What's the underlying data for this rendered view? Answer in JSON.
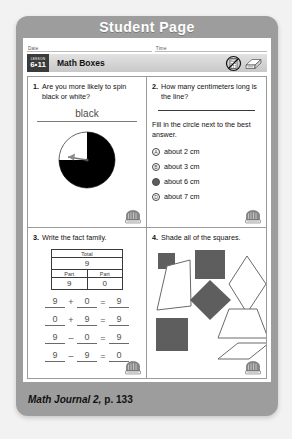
{
  "banner": {
    "title": "Student Page"
  },
  "header": {
    "date_label": "Date",
    "time_label": "Time",
    "lesson_word": "LESSON",
    "lesson_number": "6•11",
    "page_title": "Math Boxes",
    "icons": [
      "no-calculator-icon",
      "pencil-sharpener-icon"
    ]
  },
  "problems": [
    {
      "number": "1.",
      "text": "Are you more likely to spin black or white?",
      "answer": "black",
      "spinner": {
        "black_fraction": 0.75,
        "white_fraction": 0.25
      }
    },
    {
      "number": "2.",
      "text": "How many centimeters long is the line?",
      "instruction": "Fill in the circle next to the best answer.",
      "choices": [
        {
          "letter": "A",
          "label": "about 2 cm",
          "selected": false
        },
        {
          "letter": "B",
          "label": "about 3 cm",
          "selected": false
        },
        {
          "letter": "C",
          "label": "about 6 cm",
          "selected": true
        },
        {
          "letter": "D",
          "label": "about 7 cm",
          "selected": false
        }
      ]
    },
    {
      "number": "3.",
      "text": "Write the fact family.",
      "table": {
        "total_label": "Total",
        "total_value": "9",
        "part_label_left": "Part",
        "part_label_right": "Part",
        "part_value_left": "9",
        "part_value_right": "0"
      },
      "facts": [
        {
          "a": "9",
          "op": "+",
          "b": "0",
          "eq": "=",
          "c": "9"
        },
        {
          "a": "0",
          "op": "+",
          "b": "9",
          "eq": "=",
          "c": "9"
        },
        {
          "a": "9",
          "op": "–",
          "b": "0",
          "eq": "=",
          "c": "9"
        },
        {
          "a": "9",
          "op": "–",
          "b": "9",
          "eq": "=",
          "c": "0"
        }
      ]
    },
    {
      "number": "4.",
      "text": "Shade all of the squares.",
      "shapes": [
        {
          "name": "small-shaded-square",
          "shaded": true
        },
        {
          "name": "large-shaded-square",
          "shaded": true
        },
        {
          "name": "outlined-trapezoid-left",
          "shaded": false
        },
        {
          "name": "outlined-rhombus-tall",
          "shaded": false
        },
        {
          "name": "shaded-diamond",
          "shaded": true
        },
        {
          "name": "outlined-trapezoid-right",
          "shaded": false
        },
        {
          "name": "bottom-shaded-square",
          "shaded": true
        },
        {
          "name": "outlined-flat-rhombus",
          "shaded": false
        }
      ]
    }
  ],
  "footer": {
    "journal": "Math Journal 2,",
    "page": "p. 133"
  },
  "colors": {
    "frame": "#9d9d9d",
    "sheet": "#ffffff",
    "shape_fill": "#5e5e5e",
    "banner_text": "#ffffff",
    "lesson_chip": "#3b3b3b"
  }
}
